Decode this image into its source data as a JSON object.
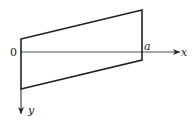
{
  "diagram": {
    "labels": {
      "origin": "0",
      "a": "a",
      "x_axis": "x",
      "y_axis": "y"
    },
    "shape": {
      "type": "quadrilateral",
      "vertices": [
        [
          21,
          39
        ],
        [
          142,
          10
        ],
        [
          142,
          60
        ],
        [
          21,
          89
        ]
      ]
    },
    "colors": {
      "stroke": "#222222",
      "background": "#ffffff"
    }
  }
}
